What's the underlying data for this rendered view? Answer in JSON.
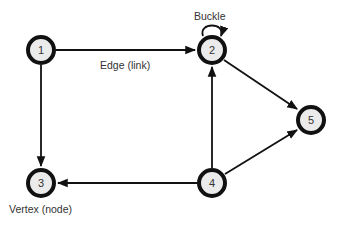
{
  "diagram": {
    "type": "directed-graph",
    "nodes": [
      {
        "id": "1",
        "label": "1",
        "x": 41,
        "y": 50
      },
      {
        "id": "2",
        "label": "2",
        "x": 212,
        "y": 50
      },
      {
        "id": "3",
        "label": "3",
        "x": 41,
        "y": 183
      },
      {
        "id": "4",
        "label": "4",
        "x": 212,
        "y": 183
      },
      {
        "id": "5",
        "label": "5",
        "x": 311,
        "y": 120
      }
    ],
    "edges": [
      {
        "from": "1",
        "to": "2"
      },
      {
        "from": "1",
        "to": "3"
      },
      {
        "from": "2",
        "to": "2",
        "kind": "self-loop"
      },
      {
        "from": "2",
        "to": "5"
      },
      {
        "from": "4",
        "to": "2"
      },
      {
        "from": "4",
        "to": "3"
      },
      {
        "from": "4",
        "to": "5"
      }
    ],
    "annotations": {
      "edge_label": "Edge (link)",
      "loop_label": "Buckle",
      "vertex_label": "Vertex (node)"
    }
  }
}
